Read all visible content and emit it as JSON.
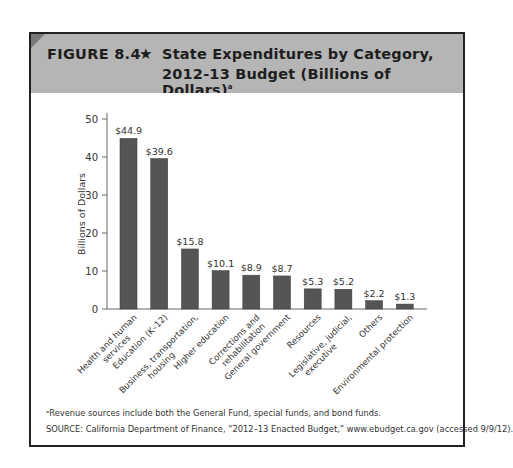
{
  "figure": {
    "label": "FIGURE 8.4",
    "star": "★",
    "title_line1": "State Expenditures by Category,",
    "title_line2": "2012-13 Budget (Billions of Dollars)",
    "title_footnote_marker": "a",
    "colors": {
      "header_bg": "#b5b5b5",
      "corner": "#7a7a7a",
      "bar": "#555555",
      "border": "#222222"
    }
  },
  "footnotes": {
    "note_a": "ᵃRevenue sources include both the General Fund, special funds, and bond funds.",
    "source": "SOURCE: California Department of Finance, “2012–13 Enacted Budget,” www.ebudget.ca.gov (accessed 9/9/12)."
  },
  "chart_data": {
    "type": "bar",
    "title": "State Expenditures by Category, 2012-13 Budget (Billions of Dollars)",
    "xlabel": "",
    "ylabel": "Billions of Dollars",
    "ylim": [
      0,
      50
    ],
    "yticks": [
      0,
      10,
      20,
      30,
      40,
      50
    ],
    "grid": false,
    "legend": null,
    "categories": [
      "Health and human services",
      "Education (K–12)",
      "Business, transportation, housing",
      "Higher education",
      "Corrections and rehabilitation",
      "General government",
      "Resources",
      "Legislative, judicial, executive",
      "Others",
      "Environmental protection"
    ],
    "category_lines": [
      [
        "Health and human",
        "services"
      ],
      [
        "Education (K–12)"
      ],
      [
        "Business, transportation,",
        "housing"
      ],
      [
        "Higher education"
      ],
      [
        "Corrections and",
        "rehabilitation"
      ],
      [
        "General government"
      ],
      [
        "Resources"
      ],
      [
        "Legislative, judicial,",
        "executive"
      ],
      [
        "Others"
      ],
      [
        "Environmental protection"
      ]
    ],
    "values": [
      44.9,
      39.6,
      15.8,
      10.1,
      8.9,
      8.7,
      5.3,
      5.2,
      2.2,
      1.3
    ],
    "data_labels": [
      "$44.9",
      "$39.6",
      "$15.8",
      "$10.1",
      "$8.9",
      "$8.7",
      "$5.3",
      "$5.2",
      "$2.2",
      "$1.3"
    ]
  }
}
